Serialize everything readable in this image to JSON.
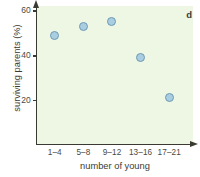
{
  "chart_data": {
    "type": "scatter",
    "title": "",
    "panel_label": "d",
    "categories": [
      "1–4",
      "5–8",
      "9–12",
      "13–16",
      "17–21"
    ],
    "values": [
      49,
      53,
      55,
      39,
      21
    ],
    "xlabel": "number of young",
    "ylabel": "surviving parents (%)",
    "ylim": [
      0,
      62
    ],
    "yticks": [
      20,
      40,
      60
    ],
    "ytick_labels": [
      "20",
      "40",
      "60"
    ],
    "grid": false,
    "legend": "none",
    "marker_color": "#a9cee1",
    "marker_edge_color": "#6f9ab4",
    "plot_background": "#eef7e3",
    "axis_color": "#3a3a32"
  }
}
